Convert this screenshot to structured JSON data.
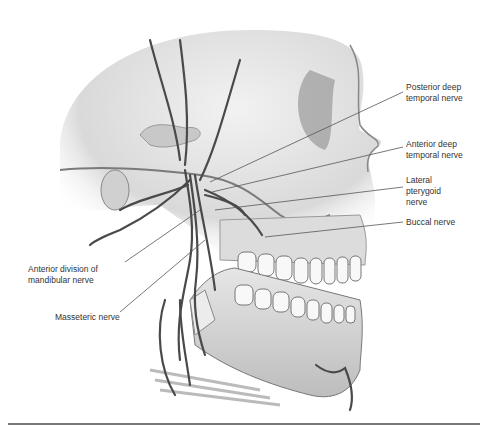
{
  "figure": {
    "labels": [
      {
        "id": "posterior-deep-temporal",
        "text": "Posterior deep\ntemporal nerve",
        "x": 406,
        "y": 82
      },
      {
        "id": "anterior-deep-temporal",
        "text": "Anterior deep\ntemporal nerve",
        "x": 406,
        "y": 139
      },
      {
        "id": "lateral-pterygoid",
        "text": "Lateral\npterygoid\nnerve",
        "x": 406,
        "y": 175
      },
      {
        "id": "buccal",
        "text": "Buccal nerve",
        "x": 406,
        "y": 217
      },
      {
        "id": "anterior-division",
        "text": "Anterior division of\nmandibular nerve",
        "x": 28,
        "y": 264
      },
      {
        "id": "masseteric",
        "text": "Masseteric nerve",
        "x": 55,
        "y": 312
      }
    ]
  }
}
